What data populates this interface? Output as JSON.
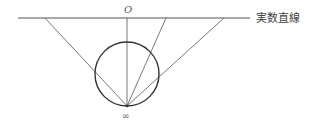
{
  "diagram": {
    "labels": {
      "origin": "O",
      "infinity": "∞",
      "real_line": "実数直線"
    },
    "colors": {
      "stroke": "#555555",
      "circle": "#333333",
      "background": "#ffffff"
    },
    "geometry": {
      "real_line": {
        "x1": 18,
        "y": 18,
        "x2": 250
      },
      "circle": {
        "cx": 127,
        "cy": 74,
        "r": 32
      },
      "projection_point": {
        "x": 127,
        "y": 106
      },
      "rays_to_line_x": [
        45,
        127,
        166,
        224
      ]
    }
  }
}
